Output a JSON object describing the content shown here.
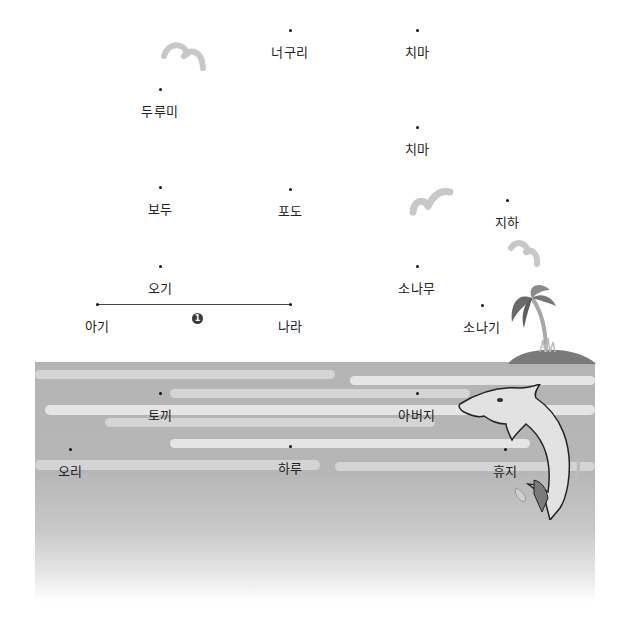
{
  "scene": {
    "description": "Korean word dot-connecting worksheet over a sea illustration",
    "colors": {
      "sea": "#b4b4b4",
      "wave_light": "#e8e8e8",
      "gull": "#c8c8c8",
      "dot": "#111111",
      "badge": "#3a3a3a"
    }
  },
  "words": [
    {
      "id": "neoguri",
      "label": "너구리",
      "x": 290,
      "y": 30
    },
    {
      "id": "chima-1",
      "label": "치마",
      "x": 417,
      "y": 30
    },
    {
      "id": "durumi",
      "label": "두루미",
      "x": 160,
      "y": 89
    },
    {
      "id": "chima-2",
      "label": "치마",
      "x": 417,
      "y": 127
    },
    {
      "id": "bodu",
      "label": "보두",
      "x": 160,
      "y": 187
    },
    {
      "id": "podo",
      "label": "포도",
      "x": 290,
      "y": 189
    },
    {
      "id": "jiha",
      "label": "지하",
      "x": 507,
      "y": 200
    },
    {
      "id": "ogi",
      "label": "오기",
      "x": 160,
      "y": 266
    },
    {
      "id": "sonamu",
      "label": "소나무",
      "x": 417,
      "y": 266
    },
    {
      "id": "agi",
      "label": "아기",
      "x": 97,
      "y": 304
    },
    {
      "id": "nara",
      "label": "나라",
      "x": 290,
      "y": 304
    },
    {
      "id": "sonagi",
      "label": "소나기",
      "x": 482,
      "y": 305
    },
    {
      "id": "tokki",
      "label": "토끼",
      "x": 160,
      "y": 393
    },
    {
      "id": "abeoji",
      "label": "아버지",
      "x": 417,
      "y": 393
    },
    {
      "id": "ori",
      "label": "오리",
      "x": 70,
      "y": 449
    },
    {
      "id": "haru",
      "label": "하루",
      "x": 290,
      "y": 446
    },
    {
      "id": "hyuji",
      "label": "휴지",
      "x": 505,
      "y": 449
    }
  ],
  "example_line": {
    "from": "agi",
    "to": "nara",
    "badge": "1"
  },
  "icons": {
    "gulls": [
      "seagull-icon",
      "seagull-icon",
      "seagull-icon"
    ],
    "island": "palm-island-icon",
    "dolphin": "dolphin-icon"
  }
}
